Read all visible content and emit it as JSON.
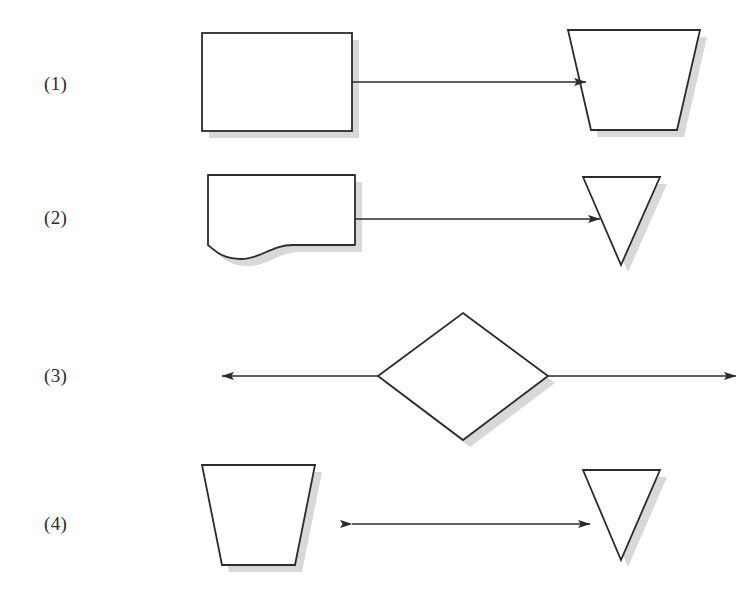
{
  "figure": {
    "type": "flowchart-symbol-exercise",
    "background_color": "#ffffff",
    "stroke_color": "#2b2b2b",
    "shape_fill": "#ffffff",
    "shadow_color": "#d8d8d8",
    "shadow_offset_px": 7,
    "stroke_width_px": 1.6,
    "width_px": 748,
    "height_px": 608
  },
  "rows": [
    {
      "label": "(1)",
      "left_shape": "rectangle",
      "right_shape": "trapezoid-wide-top",
      "connector": "arrow-right",
      "connector_direction": "left-to-right"
    },
    {
      "label": "(2)",
      "left_shape": "document-wavy-bottom",
      "right_shape": "triangle-down",
      "connector": "arrow-right",
      "connector_direction": "left-to-right"
    },
    {
      "label": "(3)",
      "left_shape": "none",
      "right_shape": "none",
      "center_shape": "diamond",
      "connector": "arrow-both-outward",
      "connector_direction": "outward-from-center"
    },
    {
      "label": "(4)",
      "left_shape": "trapezoid-wide-top",
      "right_shape": "triangle-down",
      "connector": "arrow-double-headed",
      "connector_direction": "bidirectional"
    }
  ],
  "labels": {
    "row1": "(1)",
    "row2": "(2)",
    "row3": "(3)",
    "row4": "(4)"
  }
}
